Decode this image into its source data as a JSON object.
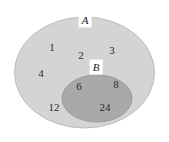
{
  "diagram": {
    "type": "venn-diagram",
    "title": "",
    "background_color": "#ffffff",
    "sets": [
      {
        "id": "A",
        "label": "A",
        "fill_color": "#d4d4d4",
        "stroke_color": "#bdbdbd",
        "label_position": "top-border",
        "members_exclusive": [
          "1",
          "2",
          "3",
          "4",
          "12"
        ]
      },
      {
        "id": "B",
        "label": "B",
        "fill_color": "#a9a9a9",
        "stroke_color": "#9a9a9a",
        "label_position": "top-border",
        "members": [
          "6",
          "8",
          "24"
        ]
      }
    ],
    "elements": [
      {
        "value": "1",
        "region": "A-only",
        "x": 52,
        "y": 47
      },
      {
        "value": "2",
        "region": "A-only",
        "x": 81,
        "y": 55
      },
      {
        "value": "3",
        "region": "A-only",
        "x": 112,
        "y": 50
      },
      {
        "value": "4",
        "region": "A-only",
        "x": 41,
        "y": 73
      },
      {
        "value": "12",
        "region": "A-only",
        "x": 54,
        "y": 107
      },
      {
        "value": "6",
        "region": "A-and-B",
        "x": 79,
        "y": 86
      },
      {
        "value": "8",
        "region": "A-and-B",
        "x": 116,
        "y": 84
      },
      {
        "value": "24",
        "region": "A-and-B",
        "x": 105,
        "y": 107
      }
    ],
    "labels": [
      {
        "text": "A",
        "x": 85,
        "y": 20
      },
      {
        "text": "B",
        "x": 96,
        "y": 67
      }
    ],
    "geometry": {
      "outer_ellipse": {
        "cx": 84.5,
        "cy": 72.5,
        "rx": 70,
        "ry": 55.5
      },
      "inner_ellipse": {
        "cx": 97,
        "cy": 98.5,
        "rx": 35,
        "ry": 23.5
      }
    }
  }
}
